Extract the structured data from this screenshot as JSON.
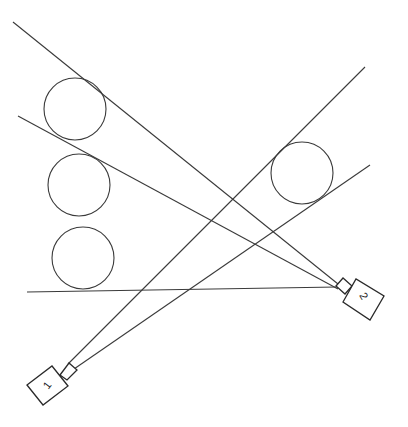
{
  "diagram": {
    "colors": {
      "stroke": "#3a3a3a",
      "background": "#ffffff"
    },
    "circles": [
      {
        "id": "circle-1",
        "cx": 75,
        "cy": 109,
        "r": 31
      },
      {
        "id": "circle-2",
        "cx": 79,
        "cy": 185,
        "r": 31
      },
      {
        "id": "circle-3",
        "cx": 83,
        "cy": 258,
        "r": 31
      },
      {
        "id": "circle-4",
        "cx": 302,
        "cy": 173,
        "r": 31
      }
    ],
    "lines": [
      {
        "id": "cam2-ray-top",
        "x1": 13,
        "y1": 22,
        "x2": 338,
        "y2": 284
      },
      {
        "id": "cam2-ray-mid",
        "x1": 18,
        "y1": 116,
        "x2": 338,
        "y2": 289
      },
      {
        "id": "cam2-ray-bottom",
        "x1": 27,
        "y1": 292,
        "x2": 337,
        "y2": 287
      },
      {
        "id": "cam1-ray-upper",
        "x1": 68,
        "y1": 364,
        "x2": 365,
        "y2": 67
      },
      {
        "id": "cam1-ray-lower",
        "x1": 74,
        "y1": 369,
        "x2": 370,
        "y2": 165
      }
    ],
    "cameras": [
      {
        "id": "camera-1",
        "label": "1",
        "body": "27,385 52,366 68,386 43,405",
        "lens": "60,375 69,363 77,370 67,380",
        "label_x": 47,
        "label_y": 389,
        "label_rotate": -52
      },
      {
        "id": "camera-2",
        "label": "2",
        "body": "343,302 356,279 384,296 370,320",
        "lens": "336,286 343,278 352,286 345,294",
        "label_x": 364,
        "label_y": 300,
        "label_rotate": 60
      }
    ]
  }
}
